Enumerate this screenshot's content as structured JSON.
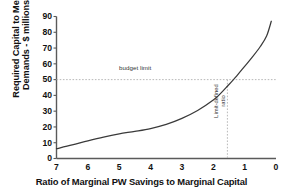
{
  "chart_data": {
    "type": "line",
    "title": "",
    "xlabel": "Ratio of Marginal PW Savings to Marginal Capital",
    "ylabel_line1": "Required Capital to Meet",
    "ylabel_line2": "Demands - $ millions",
    "xlim": [
      7,
      0
    ],
    "ylim": [
      0,
      90
    ],
    "x_reversed": true,
    "grid": false,
    "legend": null,
    "xticks": [
      7,
      6,
      5,
      4,
      3,
      2,
      1,
      0
    ],
    "yticks": [
      0,
      10,
      20,
      30,
      40,
      50,
      60,
      70,
      80,
      90
    ],
    "series": [
      {
        "name": "required capital",
        "x": [
          7.0,
          6.5,
          6.0,
          5.5,
          5.0,
          4.5,
          4.0,
          3.5,
          3.0,
          2.5,
          2.0,
          1.75,
          1.55,
          1.25,
          1.0,
          0.75,
          0.5,
          0.3,
          0.15
        ],
        "values": [
          6.2,
          8.6,
          11.2,
          13.6,
          15.6,
          17.2,
          19.0,
          21.6,
          25.4,
          30.4,
          37.0,
          41.6,
          45.8,
          52.4,
          58.4,
          64.4,
          71.0,
          77.6,
          87.0
        ]
      }
    ],
    "annotations": [
      {
        "name": "budget-limit",
        "label": "budget limit",
        "type": "hline",
        "y": 50
      },
      {
        "name": "limit-defined-ratio",
        "label_line1": "Limit-defined",
        "label_line2": "ratio",
        "type": "vline",
        "x": 1.55
      }
    ],
    "colors": {
      "curve": "#3a3a3a",
      "axis": "#5a5a5a",
      "annotation_line": "#b9b9b9",
      "text": "#111111",
      "background": "#ffffff"
    }
  }
}
